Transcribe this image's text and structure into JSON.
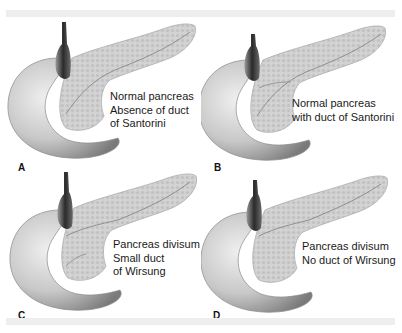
{
  "figure": {
    "type": "four-panel anatomical illustration",
    "colors": {
      "background": "#ffffff",
      "band": "#eeeeee",
      "duodenum_light": "#e4e4e4",
      "duodenum_dark": "#8a8a8a",
      "pancreas": "#cfcfcf",
      "pancreas_edge": "#9a9a9a",
      "bile_duct": "#3a3a3a",
      "text": "#1a1a1a"
    },
    "panels": [
      {
        "letter": "A",
        "caption_lines": [
          "Normal pancreas",
          "Absence of duct",
          "of Santorini"
        ]
      },
      {
        "letter": "B",
        "caption_lines": [
          "Normal pancreas",
          "with duct of Santorini"
        ]
      },
      {
        "letter": "C",
        "caption_lines": [
          "Pancreas divisum",
          "Small duct",
          "of Wirsung"
        ]
      },
      {
        "letter": "D",
        "caption_lines": [
          "Pancreas divisum",
          "No duct of Wirsung"
        ]
      }
    ]
  }
}
